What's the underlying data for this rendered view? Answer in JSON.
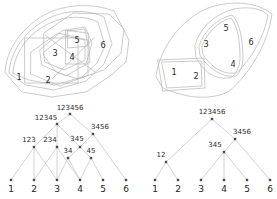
{
  "figure": {
    "background_color": "#ffffff",
    "line_color": "#b5b5b5",
    "node_color": "#4a4a4a",
    "text_color": "#2a2a2a",
    "ground_set": [
      "1",
      "2",
      "3",
      "4",
      "5",
      "6"
    ]
  },
  "euler_left": {
    "caption": "non-laminar set family",
    "region_labels": [
      {
        "text": "1",
        "x": 19,
        "y": 77
      },
      {
        "text": "2",
        "x": 48,
        "y": 80
      },
      {
        "text": "3",
        "x": 55,
        "y": 53
      },
      {
        "text": "4",
        "x": 72,
        "y": 57
      },
      {
        "text": "5",
        "x": 77,
        "y": 40
      },
      {
        "text": "6",
        "x": 103,
        "y": 45
      }
    ],
    "contours": [
      "123456",
      "12345",
      "123",
      "234",
      "345",
      "34",
      "45",
      "3456"
    ]
  },
  "euler_right": {
    "caption": "laminar set family",
    "region_labels": [
      {
        "text": "1",
        "x": 174,
        "y": 72
      },
      {
        "text": "2",
        "x": 196,
        "y": 76
      },
      {
        "text": "3",
        "x": 206,
        "y": 44
      },
      {
        "text": "4",
        "x": 233,
        "y": 64
      },
      {
        "text": "5",
        "x": 226,
        "y": 28
      },
      {
        "text": "6",
        "x": 251,
        "y": 42
      }
    ],
    "contours": [
      "123456",
      "12",
      "3456",
      "345"
    ]
  },
  "lattice_left": {
    "caption": "Hasse diagram of the non-laminar family",
    "nodes": [
      {
        "id": "L1",
        "label": "1",
        "x": 11,
        "y": 180,
        "type": "leaf",
        "label_x": 11,
        "label_y": 192
      },
      {
        "id": "L2",
        "label": "2",
        "x": 34,
        "y": 180,
        "type": "leaf",
        "label_x": 34,
        "label_y": 192
      },
      {
        "id": "L3",
        "label": "3",
        "x": 57,
        "y": 180,
        "type": "leaf",
        "label_x": 57,
        "label_y": 192
      },
      {
        "id": "L4",
        "label": "4",
        "x": 80,
        "y": 180,
        "type": "leaf",
        "label_x": 80,
        "label_y": 192
      },
      {
        "id": "L5",
        "label": "5",
        "x": 103,
        "y": 180,
        "type": "leaf",
        "label_x": 103,
        "label_y": 192
      },
      {
        "id": "L6",
        "label": "6",
        "x": 126,
        "y": 180,
        "type": "leaf",
        "label_x": 126,
        "label_y": 192
      },
      {
        "id": "L34",
        "label": "34",
        "x": 68,
        "y": 158,
        "type": "internal",
        "label_x": 68,
        "label_y": 153
      },
      {
        "id": "L45",
        "label": "45",
        "x": 91,
        "y": 158,
        "type": "internal",
        "label_x": 91,
        "label_y": 153
      },
      {
        "id": "L123",
        "label": "123",
        "x": 34,
        "y": 147,
        "type": "internal",
        "label_x": 29,
        "label_y": 142
      },
      {
        "id": "L234",
        "label": "234",
        "x": 57,
        "y": 147,
        "type": "internal",
        "label_x": 50,
        "label_y": 142
      },
      {
        "id": "L345",
        "label": "345",
        "x": 80,
        "y": 147,
        "type": "internal",
        "label_x": 77,
        "label_y": 141
      },
      {
        "id": "L3456",
        "label": "3456",
        "x": 93,
        "y": 134,
        "type": "internal",
        "label_x": 100,
        "label_y": 129
      },
      {
        "id": "L12345",
        "label": "12345",
        "x": 57,
        "y": 124,
        "type": "internal",
        "label_x": 46,
        "label_y": 120
      },
      {
        "id": "L123456",
        "label": "123456",
        "x": 70,
        "y": 114,
        "type": "root",
        "label_x": 70,
        "label_y": 110
      }
    ],
    "edges": [
      [
        "L123456",
        "L12345"
      ],
      [
        "L123456",
        "L3456"
      ],
      [
        "L12345",
        "L123"
      ],
      [
        "L12345",
        "L234"
      ],
      [
        "L12345",
        "L345"
      ],
      [
        "L3456",
        "L345"
      ],
      [
        "L3456",
        "L6"
      ],
      [
        "L345",
        "L34"
      ],
      [
        "L345",
        "L45"
      ],
      [
        "L123",
        "L1"
      ],
      [
        "L123",
        "L2"
      ],
      [
        "L123",
        "L3"
      ],
      [
        "L234",
        "L2"
      ],
      [
        "L234",
        "L3"
      ],
      [
        "L234",
        "L4"
      ],
      [
        "L34",
        "L3"
      ],
      [
        "L34",
        "L4"
      ],
      [
        "L45",
        "L4"
      ],
      [
        "L45",
        "L5"
      ]
    ]
  },
  "lattice_right": {
    "caption": "Hasse diagram of the laminar family",
    "nodes": [
      {
        "id": "R1",
        "label": "1",
        "x": 155,
        "y": 180,
        "type": "leaf",
        "label_x": 155,
        "label_y": 192
      },
      {
        "id": "R2",
        "label": "2",
        "x": 178,
        "y": 180,
        "type": "leaf",
        "label_x": 178,
        "label_y": 192
      },
      {
        "id": "R3",
        "label": "3",
        "x": 201,
        "y": 180,
        "type": "leaf",
        "label_x": 201,
        "label_y": 192
      },
      {
        "id": "R4",
        "label": "4",
        "x": 224,
        "y": 180,
        "type": "leaf",
        "label_x": 224,
        "label_y": 192
      },
      {
        "id": "R5",
        "label": "5",
        "x": 247,
        "y": 180,
        "type": "leaf",
        "label_x": 247,
        "label_y": 192
      },
      {
        "id": "R6",
        "label": "6",
        "x": 270,
        "y": 180,
        "type": "leaf",
        "label_x": 270,
        "label_y": 192
      },
      {
        "id": "R12",
        "label": "12",
        "x": 166,
        "y": 162,
        "type": "internal",
        "label_x": 161,
        "label_y": 157
      },
      {
        "id": "R345",
        "label": "345",
        "x": 224,
        "y": 152,
        "type": "internal",
        "label_x": 215,
        "label_y": 147
      },
      {
        "id": "R3456",
        "label": "3456",
        "x": 235,
        "y": 139,
        "type": "internal",
        "label_x": 242,
        "label_y": 134
      },
      {
        "id": "R123456",
        "label": "123456",
        "x": 212,
        "y": 119,
        "type": "root",
        "label_x": 212,
        "label_y": 114
      }
    ],
    "edges": [
      [
        "R123456",
        "R12"
      ],
      [
        "R123456",
        "R3456"
      ],
      [
        "R3456",
        "R345"
      ],
      [
        "R3456",
        "R6"
      ],
      [
        "R345",
        "R3"
      ],
      [
        "R345",
        "R4"
      ],
      [
        "R345",
        "R5"
      ],
      [
        "R12",
        "R1"
      ],
      [
        "R12",
        "R2"
      ]
    ]
  }
}
